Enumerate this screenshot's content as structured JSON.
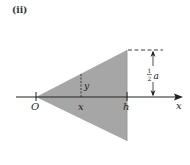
{
  "panel_label": "(ii)",
  "labels": {
    "origin": "O",
    "x_marker": "x",
    "h_marker": "h",
    "axis": "x",
    "y_height": "y",
    "half_num": "1",
    "half_den": "2",
    "a": "a"
  },
  "colors": {
    "fill": "#a6a6a6",
    "line": "#222222"
  },
  "geometry": {
    "axis_y": 97,
    "axis_x_start": 16,
    "axis_x_end": 183,
    "origin_x": 36,
    "x_marker_x": 81,
    "h_x": 127,
    "triangle_top_y": 50,
    "triangle_bottom_y": 141,
    "dim_arrow_x": 153
  }
}
